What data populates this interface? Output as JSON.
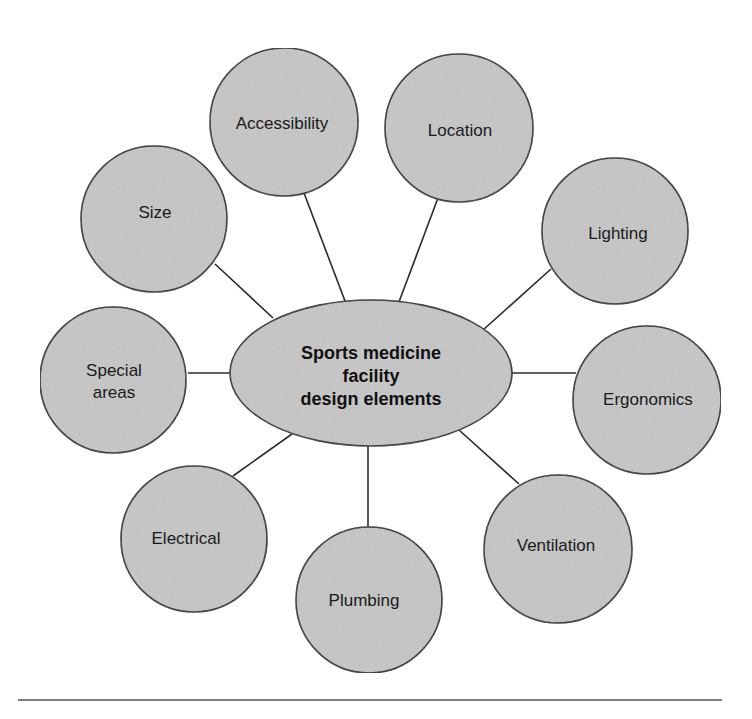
{
  "center": {
    "lines": [
      "Sports medicine",
      "facility",
      "design elements"
    ]
  },
  "nodes": [
    {
      "label_lines": [
        "Accessibility"
      ]
    },
    {
      "label_lines": [
        "Location"
      ]
    },
    {
      "label_lines": [
        "Size"
      ]
    },
    {
      "label_lines": [
        "Lighting"
      ]
    },
    {
      "label_lines": [
        "Special",
        "areas"
      ]
    },
    {
      "label_lines": [
        "Ergonomics"
      ]
    },
    {
      "label_lines": [
        "Electrical"
      ]
    },
    {
      "label_lines": [
        "Ventilation"
      ]
    },
    {
      "label_lines": [
        "Plumbing"
      ]
    }
  ],
  "colors": {
    "fill": "#c6c6c6",
    "stroke": "#2a2a2a",
    "divider": "#555555"
  }
}
